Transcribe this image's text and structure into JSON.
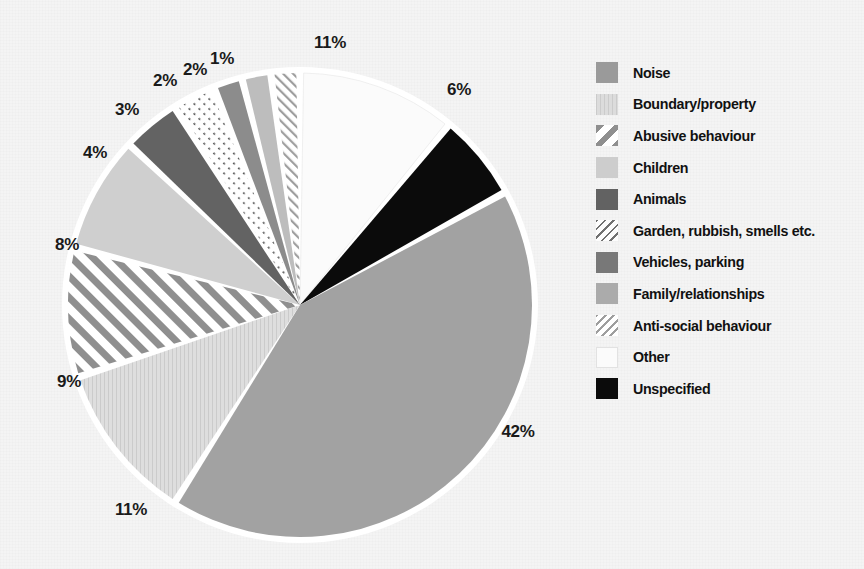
{
  "chart_data": {
    "type": "pie",
    "title": "",
    "subtitle": "",
    "xlabel": "",
    "ylabel": "",
    "legend_position": "right",
    "grid": false,
    "unit": "%",
    "start_angle_deg": 0,
    "direction": "clockwise",
    "categories": [
      "Other",
      "Unspecified",
      "Noise",
      "Boundary/property",
      "Abusive behaviour",
      "Children",
      "Animals",
      "Garden, rubbish, smells etc.",
      "Vehicles, parking",
      "Family/relationships",
      "Anti-social behaviour"
    ],
    "values": [
      11,
      6,
      42,
      11,
      9,
      8,
      4,
      3,
      2,
      2,
      1
    ],
    "data_labels": [
      "11%",
      "6%",
      "42%",
      "11%",
      "9%",
      "8%",
      "4%",
      "3%",
      "2%",
      "2%",
      "1%"
    ],
    "slices": [
      {
        "label": "Other",
        "value": 11,
        "data_label": "11%",
        "fill": "#fbfbfb",
        "pattern": "solid",
        "start_deg": 0,
        "end_deg": 39.6
      },
      {
        "label": "Unspecified",
        "value": 6,
        "data_label": "6%",
        "fill": "#0b0b0b",
        "pattern": "solid",
        "start_deg": 39.6,
        "end_deg": 61.2
      },
      {
        "label": "Noise",
        "value": 42,
        "data_label": "42%",
        "fill": "#a2a2a2",
        "pattern": "solid",
        "start_deg": 61.2,
        "end_deg": 212.4
      },
      {
        "label": "Boundary/property",
        "value": 11,
        "data_label": "11%",
        "fill": "#dcdcdc",
        "pattern": "vertical-fine",
        "start_deg": 212.4,
        "end_deg": 252.0
      },
      {
        "label": "Abusive behaviour",
        "value": 9,
        "data_label": "9%",
        "fill": "#ffffff",
        "pattern": "diagonal-thick",
        "start_deg": 252.0,
        "end_deg": 284.4
      },
      {
        "label": "Children",
        "value": 8,
        "data_label": "8%",
        "fill": "#cfcfcf",
        "pattern": "solid",
        "start_deg": 284.4,
        "end_deg": 313.2
      },
      {
        "label": "Animals",
        "value": 4,
        "data_label": "4%",
        "fill": "#636363",
        "pattern": "solid",
        "start_deg": 313.2,
        "end_deg": 327.6
      },
      {
        "label": "Garden, rubbish, smells etc.",
        "value": 3,
        "data_label": "3%",
        "fill": "#fdfdfd",
        "pattern": "diagonal-dotted",
        "start_deg": 327.6,
        "end_deg": 338.4
      },
      {
        "label": "Vehicles, parking",
        "value": 2,
        "data_label": "2%",
        "fill": "#8c8c8c",
        "pattern": "solid",
        "start_deg": 338.4,
        "end_deg": 345.6
      },
      {
        "label": "Family/relationships",
        "value": 2,
        "data_label": "2%",
        "fill": "#bdbdbd",
        "pattern": "solid",
        "start_deg": 345.6,
        "end_deg": 352.8
      },
      {
        "label": "Anti-social behaviour",
        "value": 1,
        "data_label": "1%",
        "fill": "#ffffff",
        "pattern": "diagonal-fine",
        "start_deg": 352.8,
        "end_deg": 360.0
      }
    ]
  },
  "pie": {
    "center_x": 300,
    "center_y": 305,
    "radius": 232,
    "gap_color": "#ffffff",
    "labels": [
      {
        "text": "11%",
        "x": 330,
        "y": 43
      },
      {
        "text": "6%",
        "x": 459,
        "y": 90
      },
      {
        "text": "42%",
        "x": 518,
        "y": 432
      },
      {
        "text": "11%",
        "x": 131,
        "y": 510
      },
      {
        "text": "9%",
        "x": 69,
        "y": 382
      },
      {
        "text": "8%",
        "x": 67,
        "y": 245
      },
      {
        "text": "4%",
        "x": 95,
        "y": 153
      },
      {
        "text": "3%",
        "x": 127,
        "y": 110
      },
      {
        "text": "2%",
        "x": 165,
        "y": 81
      },
      {
        "text": "2%",
        "x": 195,
        "y": 70
      },
      {
        "text": "1%",
        "x": 222,
        "y": 59
      }
    ]
  },
  "legend": {
    "items": [
      {
        "label": "Noise",
        "swatch_name": "legend-swatch-noise",
        "fill": "#9a9a9a",
        "pattern": "solid"
      },
      {
        "label": "Boundary/property",
        "swatch_name": "legend-swatch-boundary-property",
        "fill": "#dcdcdc",
        "pattern": "vertical-fine"
      },
      {
        "label": "Abusive behaviour",
        "swatch_name": "legend-swatch-abusive-behaviour",
        "fill": "#ffffff",
        "pattern": "diagonal-thick"
      },
      {
        "label": "Children",
        "swatch_name": "legend-swatch-children",
        "fill": "#cdcdcd",
        "pattern": "solid"
      },
      {
        "label": "Animals",
        "swatch_name": "legend-swatch-animals",
        "fill": "#626262",
        "pattern": "solid"
      },
      {
        "label": "Garden, rubbish, smells etc.",
        "swatch_name": "legend-swatch-garden-rubbish-smells",
        "fill": "#fdfdfd",
        "pattern": "diagonal-dotted"
      },
      {
        "label": "Vehicles, parking",
        "swatch_name": "legend-swatch-vehicles-parking",
        "fill": "#787878",
        "pattern": "solid"
      },
      {
        "label": "Family/relationships",
        "swatch_name": "legend-swatch-family-relationships",
        "fill": "#ababab",
        "pattern": "solid"
      },
      {
        "label": "Anti-social behaviour",
        "swatch_name": "legend-swatch-anti-social-behaviour",
        "fill": "#ffffff",
        "pattern": "diagonal-fine"
      },
      {
        "label": "Other",
        "swatch_name": "legend-swatch-other",
        "fill": "#fbfbfb",
        "pattern": "solid"
      },
      {
        "label": "Unspecified",
        "swatch_name": "legend-swatch-unspecified",
        "fill": "#0b0b0b",
        "pattern": "solid"
      }
    ]
  },
  "colors": {
    "background": "#f4f4f4",
    "text": "#111111",
    "slice_gap": "#ffffff"
  }
}
